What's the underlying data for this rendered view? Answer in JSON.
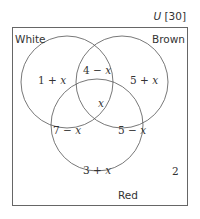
{
  "universe": {
    "symbol": "U",
    "total": "[30]"
  },
  "sets": [
    {
      "name": "White",
      "cx": 67,
      "cy": 82,
      "r": 46
    },
    {
      "name": "Brown",
      "cx": 122,
      "cy": 82,
      "r": 46
    },
    {
      "name": "Red",
      "cx": 97,
      "cy": 125,
      "r": 46
    }
  ],
  "regions": {
    "white_only": {
      "num": "1 + ",
      "var": "x"
    },
    "white_brown": {
      "num": "4 − ",
      "var": "x"
    },
    "brown_only": {
      "num": "5 + ",
      "var": "x"
    },
    "all_three": {
      "num": "",
      "var": "x"
    },
    "white_red": {
      "num": "7 − ",
      "var": "x"
    },
    "brown_red": {
      "num": "5 − ",
      "var": "x"
    },
    "red_only": {
      "num": "3 + ",
      "var": "x"
    },
    "outside": "2"
  },
  "colors": {
    "stroke": "#555555",
    "text": "#333333"
  }
}
